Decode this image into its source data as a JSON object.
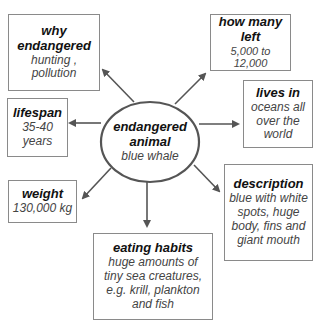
{
  "center": {
    "title_line1": "endangered",
    "title_line2": "animal",
    "detail": "blue whale"
  },
  "nodes": {
    "why_endangered": {
      "title_line1": "why",
      "title_line2": "endangered",
      "detail_line1": "hunting ,",
      "detail_line2": "pollution"
    },
    "how_many_left": {
      "title_line1": "how many",
      "title_line2": "left",
      "detail_line1": "5,000 to 12,000"
    },
    "lives_in": {
      "title_line1": "lives in",
      "detail_line1": "oceans all",
      "detail_line2": "over the",
      "detail_line3": "world"
    },
    "lifespan": {
      "title_line1": "lifespan",
      "detail_line1": "35-40",
      "detail_line2": "years"
    },
    "weight": {
      "title_line1": "weight",
      "detail_line1": "130,000 kg"
    },
    "eating_habits": {
      "title_line1": "eating habits",
      "detail_line1": "huge amounts of",
      "detail_line2": "tiny sea creatures,",
      "detail_line3": "e.g. krill, plankton",
      "detail_line4": "and fish"
    },
    "description": {
      "title_line1": "description",
      "detail_line1": "blue with white",
      "detail_line2": "spots, huge",
      "detail_line3": "body, fins and",
      "detail_line4": "giant mouth"
    }
  },
  "colors": {
    "line": "#555555",
    "border": "#8a8a8a",
    "title": "#111111",
    "detail": "#444444"
  }
}
